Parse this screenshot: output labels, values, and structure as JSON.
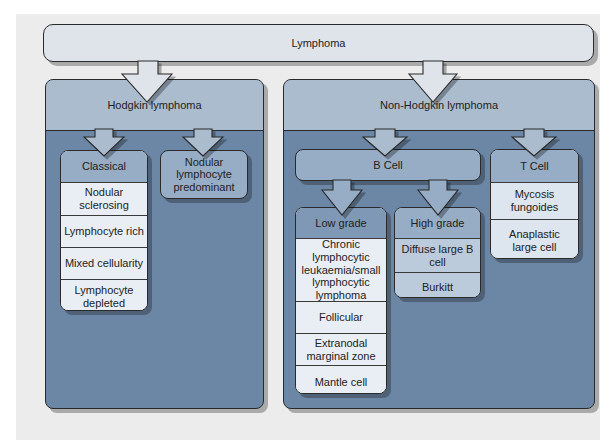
{
  "root": {
    "label": "Lymphoma"
  },
  "hodgkin": {
    "label": "Hodgkin lymphoma",
    "classical": {
      "label": "Classical",
      "items": [
        "Nodular sclerosing",
        "Lymphocyte rich",
        "Mixed cellularity",
        "Lymphocyte depleted"
      ]
    },
    "nodular": {
      "label": "Nodular lymphocyte predominant"
    }
  },
  "non_hodgkin": {
    "label": "Non-Hodgkin lymphoma",
    "b_cell": {
      "label": "B Cell",
      "low_grade": {
        "label": "Low grade",
        "items": [
          "Chronic lymphocytic leukaemia/small lymphocytic lymphoma",
          "Follicular",
          "Extranodal marginal zone",
          "Mantle cell"
        ]
      },
      "high_grade": {
        "label": "High grade",
        "items": [
          "Diffuse large B cell",
          "Burkitt"
        ]
      }
    },
    "t_cell": {
      "label": "T Cell",
      "items": [
        "Mycosis fungoides",
        "Anaplastic large cell"
      ]
    }
  },
  "colors": {
    "background": "#ececec",
    "root_fill": "#dfe4ea",
    "panel_header": "#abbccf",
    "panel_body": "#6c87a6",
    "sub_header": "#97adc5",
    "item_fill": "#e9eef4",
    "low_grade_header": "#7f98b5",
    "high_grade_item": "#bccbdc"
  }
}
